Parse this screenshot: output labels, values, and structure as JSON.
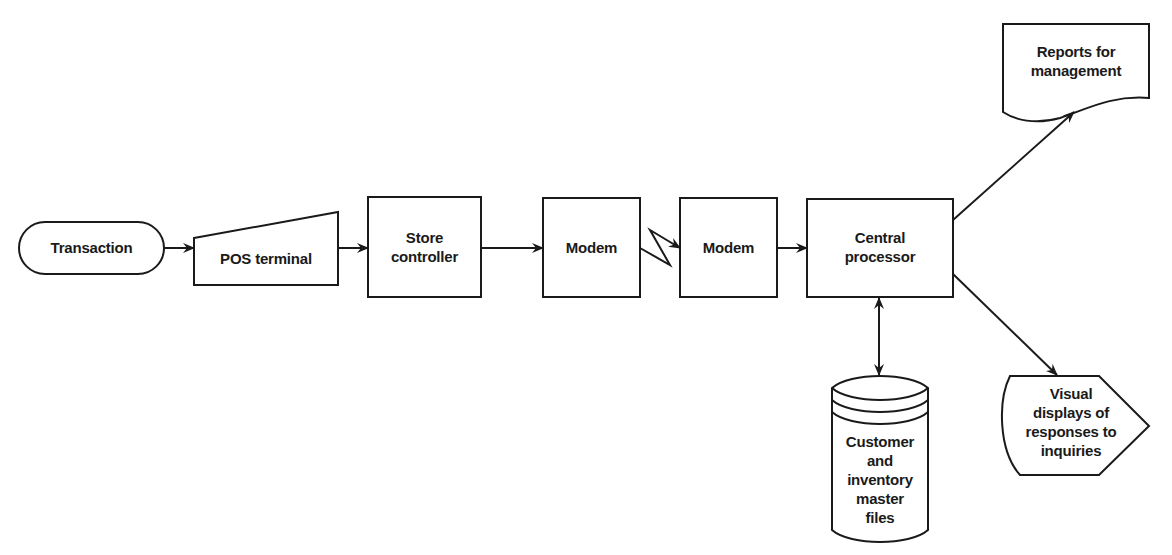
{
  "diagram": {
    "type": "flowchart",
    "stroke_color": "#1a1a1a",
    "background": "#ffffff",
    "nodes": [
      {
        "id": "transaction",
        "shape": "terminal",
        "label": "Transaction"
      },
      {
        "id": "pos_terminal",
        "shape": "manual-input",
        "label": "POS terminal"
      },
      {
        "id": "store_controller",
        "shape": "process",
        "label": "Store controller",
        "lines": [
          "Store",
          "controller"
        ]
      },
      {
        "id": "modem_1",
        "shape": "process",
        "label": "Modem"
      },
      {
        "id": "modem_2",
        "shape": "process",
        "label": "Modem"
      },
      {
        "id": "central_processor",
        "shape": "process",
        "label": "Central processor",
        "lines": [
          "Central",
          "processor"
        ]
      },
      {
        "id": "reports",
        "shape": "document",
        "label": "Reports for management",
        "lines": [
          "Reports for",
          "management"
        ]
      },
      {
        "id": "visual_displays",
        "shape": "display",
        "label": "Visual displays of responses to inquiries",
        "lines": [
          "Visual",
          "displays of",
          "responses to",
          "inquiries"
        ]
      },
      {
        "id": "master_files",
        "shape": "magnetic-disk",
        "label": "Customer and inventory master files",
        "lines": [
          "Customer",
          "and",
          "inventory",
          "master",
          "files"
        ]
      }
    ],
    "edges": [
      {
        "from": "transaction",
        "to": "pos_terminal",
        "style": "arrow"
      },
      {
        "from": "pos_terminal",
        "to": "store_controller",
        "style": "arrow"
      },
      {
        "from": "store_controller",
        "to": "modem_1",
        "style": "arrow"
      },
      {
        "from": "modem_1",
        "to": "modem_2",
        "style": "communication-link"
      },
      {
        "from": "modem_2",
        "to": "central_processor",
        "style": "arrow"
      },
      {
        "from": "central_processor",
        "to": "reports",
        "style": "arrow"
      },
      {
        "from": "central_processor",
        "to": "visual_displays",
        "style": "arrow"
      },
      {
        "from": "central_processor",
        "to": "master_files",
        "style": "bidirectional-arrow"
      }
    ]
  }
}
